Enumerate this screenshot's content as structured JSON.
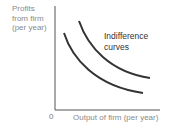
{
  "diagram": {
    "type": "indifference-curves",
    "y_axis_label": [
      "Profits",
      "from firm",
      "(per year)"
    ],
    "x_axis_label": "Output of firm (per year)",
    "origin_label": "0",
    "curves_label": [
      "Indifference",
      "curves"
    ],
    "curve_count": 2,
    "colors": {
      "curves": "#333333",
      "axes": "#555555",
      "axis_text": "#8a8a8a"
    }
  }
}
